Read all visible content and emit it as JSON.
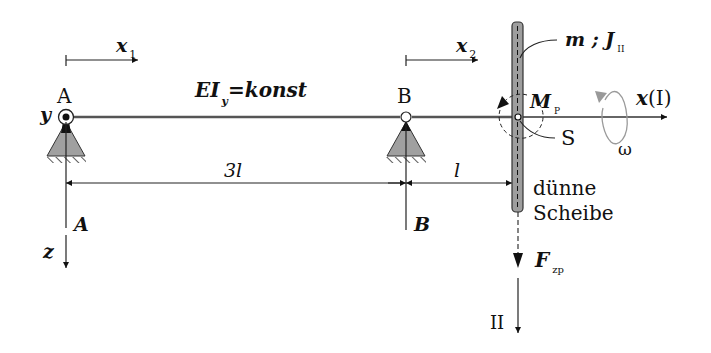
{
  "diagram": {
    "type": "mechanics-beam-with-disc",
    "beam": {
      "stiffness_label": "EI",
      "stiffness_sub": "y",
      "stiffness_rhs": "=konst"
    },
    "coords": {
      "x1": {
        "base": "x",
        "sub": "1"
      },
      "x2": {
        "base": "x",
        "sub": "2"
      },
      "x_axis": "x",
      "x_axis_paren": "(I)",
      "y_axis": "y",
      "z_axis": "z",
      "axis_II": "II"
    },
    "supports": {
      "A": {
        "label": "A",
        "reaction": "A"
      },
      "B": {
        "label": "B",
        "reaction": "B"
      }
    },
    "dimensions": {
      "span_AB": "3l",
      "span_B_disc": "l"
    },
    "disc": {
      "mass_label": "m ; J",
      "inertia_sub": "II",
      "description_line1": "dünne",
      "description_line2": "Scheibe",
      "center_label": "S"
    },
    "moment": {
      "base": "M",
      "sub": "P"
    },
    "force": {
      "base": "F",
      "sub": "zp"
    },
    "rotation": {
      "label": "ω"
    },
    "colors": {
      "line": "#222222",
      "support_fill": "#a0a0a0",
      "disc_fill": "#9e9e9e",
      "omega_arrow": "#9a9a9a"
    }
  }
}
